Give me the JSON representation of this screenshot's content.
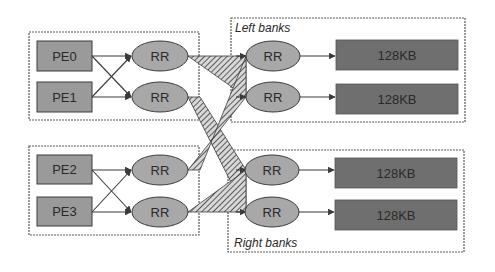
{
  "diagram": {
    "title": "",
    "colors": {
      "background": "#ffffff",
      "pe_fill": "#9a9a9a",
      "rr_fill": "#a8a8a8",
      "bank_fill": "#6f6f6f",
      "stroke": "#3a3a3a",
      "group_border": "#5a5a5a"
    },
    "processing_elements": [
      {
        "id": "pe0",
        "label": "PE0"
      },
      {
        "id": "pe1",
        "label": "PE1"
      },
      {
        "id": "pe2",
        "label": "PE2"
      },
      {
        "id": "pe3",
        "label": "PE3"
      }
    ],
    "input_routers": [
      {
        "id": "rr-in-0",
        "label": "RR"
      },
      {
        "id": "rr-in-1",
        "label": "RR"
      },
      {
        "id": "rr-in-2",
        "label": "RR"
      },
      {
        "id": "rr-in-3",
        "label": "RR"
      }
    ],
    "left_banks": {
      "label": "Left banks",
      "routers": [
        {
          "label": "RR"
        },
        {
          "label": "RR"
        }
      ],
      "memories": [
        {
          "label": "128KB"
        },
        {
          "label": "128KB"
        }
      ]
    },
    "right_banks": {
      "label": "Right banks",
      "routers": [
        {
          "label": "RR"
        },
        {
          "label": "RR"
        }
      ],
      "memories": [
        {
          "label": "128KB"
        },
        {
          "label": "128KB"
        }
      ]
    },
    "edges": [
      "PE0->RR0",
      "PE0->RR1",
      "PE1->RR0",
      "PE1->RR1",
      "PE2->RR2",
      "PE2->RR3",
      "PE3->RR2",
      "PE3->RR3",
      "RR0->LeftRR0",
      "RR0->LeftRR1",
      "RR1->RightRR0",
      "RR1->RightRR1",
      "RR2->LeftRR0",
      "RR2->LeftRR1",
      "RR3->RightRR0",
      "RR3->RightRR1",
      "LeftRR0->128KB",
      "LeftRR1->128KB",
      "RightRR0->128KB",
      "RightRR1->128KB"
    ]
  }
}
